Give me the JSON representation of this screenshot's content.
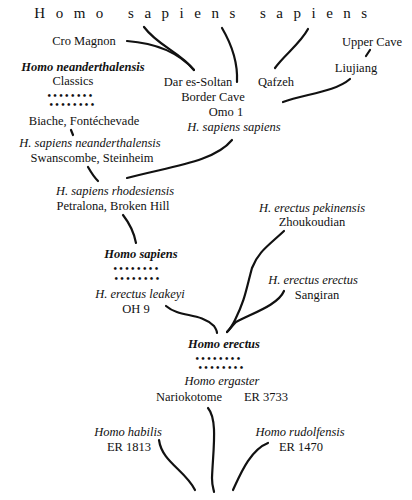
{
  "diagram": {
    "title": "Homo sapiens sapiens",
    "nodes": {
      "cro_magnon": "Cro Magnon",
      "upper_cave": "Upper Cave",
      "liujiang": "Liujiang",
      "h_neanderthalensis": "Homo neanderthalensis",
      "classics": "Classics",
      "dar_es_soltan": "Dar es-Soltan",
      "qafzeh": "Qafzeh",
      "border_cave": "Border Cave",
      "omo1": "Omo 1",
      "biache": "Biache, Fontéchevade",
      "h_s_sapiens": "H. sapiens sapiens",
      "h_s_neanderthalensis": "H. sapiens neanderthalensis",
      "swanscombe": "Swanscombe, Steinheim",
      "h_s_rhodesiensis": "H. sapiens rhodesiensis",
      "petralona": "Petralona,  Broken Hill",
      "h_e_pekinensis": "H. erectus pekinensis",
      "zhoukoudian": "Zhoukoudian",
      "homo_sapiens": "Homo sapiens",
      "h_e_erectus": "H. erectus erectus",
      "sangiran": "Sangiran",
      "h_e_leakeyi": "H. erectus leakeyi",
      "oh9": "OH 9",
      "homo_erectus": "Homo erectus",
      "homo_ergaster": "Homo ergaster",
      "nariokotome": "Nariokotome",
      "er3733": "ER 3733",
      "homo_habilis": "Homo habilis",
      "er1813": "ER  1813",
      "homo_rudolfensis": "Homo rudolfensis",
      "er1470": "ER 1470"
    },
    "dots": {
      "neanderthal_row1": "••••••••",
      "neanderthal_row2": "••••••••",
      "sapiens_row1": "••••••••",
      "sapiens_row2": "••••••••",
      "erectus_row1": "••••••••",
      "erectus_row2": "••••••••"
    }
  }
}
